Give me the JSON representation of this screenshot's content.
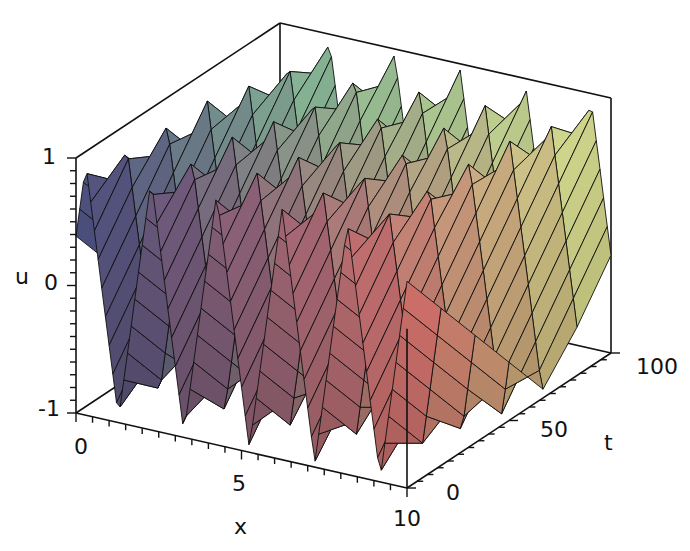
{
  "chart_data": {
    "type": "surface3d",
    "title": "",
    "xlabel": "x",
    "ylabel": "t",
    "zlabel": "u",
    "x_range": [
      0,
      10
    ],
    "t_range": [
      0,
      100
    ],
    "u_range": [
      -1,
      1
    ],
    "x_ticks": [
      {
        "value": 0,
        "label": "0"
      },
      {
        "value": 5,
        "label": "5"
      },
      {
        "value": 10,
        "label": "10"
      }
    ],
    "t_ticks": [
      {
        "value": 0,
        "label": "0"
      },
      {
        "value": 50,
        "label": "50"
      },
      {
        "value": 100,
        "label": "100"
      }
    ],
    "u_ticks": [
      {
        "value": -1,
        "label": "-1"
      },
      {
        "value": 0,
        "label": "0"
      },
      {
        "value": 1,
        "label": "1"
      }
    ],
    "surface": {
      "wave_periods_in_x": 2.2,
      "phase_drift_per_t": 0.006,
      "x_samples": 90,
      "t_samples": 6
    },
    "colors": {
      "low_x_high_t": "#7fb89a",
      "low_x_low_t": "#4a4a80",
      "high_x_low_t": "#d96b6b",
      "high_x_high_t": "#d8e690",
      "grid_line": "#111111",
      "box": "#111111"
    },
    "grid": false,
    "legend": null
  }
}
